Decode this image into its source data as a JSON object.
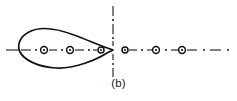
{
  "figure": {
    "caption": "(b)",
    "type": "two-lobe bowtie / figure-eight molecular orbital diagram",
    "colors": {
      "stroke": "#111111",
      "background": "#ffffff",
      "axis": "#1a1a1a"
    },
    "canvas": {
      "width": 237,
      "height": 101
    },
    "center": {
      "x": 113,
      "y": 50
    },
    "horizontal_axis": {
      "label": "horizontal dash-dot symmetry axis",
      "y": 50,
      "x_start": 6,
      "x_end": 231,
      "style": "dash-dot"
    },
    "vertical_axis": {
      "label": "vertical dash-dot symmetry axis",
      "x": 113,
      "y_start": 6,
      "y_end": 76,
      "style": "dash-dot"
    },
    "lobes": [
      {
        "name": "left-lobe",
        "tip": {
          "x": 113,
          "y": 50
        },
        "bulb_center": {
          "x": 48,
          "y": 50
        },
        "bulb_left_x": 20,
        "half_height": 23
      },
      {
        "name": "right-lobe",
        "tip": {
          "x": 113,
          "y": 50
        },
        "bulb_center": {
          "x": 178,
          "y": 50
        },
        "bulb_right_x": 206,
        "half_height": 23
      }
    ],
    "nodes": [
      {
        "name": "node-left-outer",
        "x": 44,
        "y": 50,
        "r": 3.4
      },
      {
        "name": "node-left-inner",
        "x": 70,
        "y": 50,
        "r": 3.4
      },
      {
        "name": "node-center-left",
        "x": 100,
        "y": 50,
        "r": 3.0
      },
      {
        "name": "node-center-right",
        "x": 126,
        "y": 50,
        "r": 3.0
      },
      {
        "name": "node-right-inner",
        "x": 156,
        "y": 50,
        "r": 3.4
      },
      {
        "name": "node-right-outer",
        "x": 182,
        "y": 50,
        "r": 3.4
      }
    ]
  }
}
